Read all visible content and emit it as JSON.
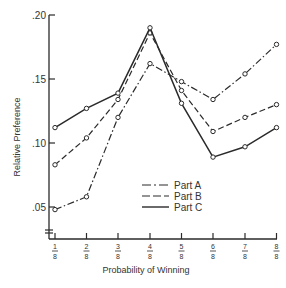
{
  "chart_data": {
    "type": "line",
    "title": "",
    "xlabel": "Probability of Winning",
    "ylabel": "Relative Preference",
    "categories": [
      "1/8",
      "2/8",
      "3/8",
      "4/8",
      "5/8",
      "6/8",
      "7/8",
      "8/8"
    ],
    "x_tick_labels": [
      {
        "num": "1",
        "den": "8"
      },
      {
        "num": "2",
        "den": "8"
      },
      {
        "num": "3",
        "den": "8"
      },
      {
        "num": "4",
        "den": "8"
      },
      {
        "num": "5",
        "den": "8"
      },
      {
        "num": "6",
        "den": "8"
      },
      {
        "num": "7",
        "den": "8"
      },
      {
        "num": "8",
        "den": "8"
      }
    ],
    "y_ticks": [
      0.05,
      0.1,
      0.15,
      0.2
    ],
    "y_tick_labels": [
      ".05",
      ".10",
      ".15",
      ".20"
    ],
    "ylim": [
      0.03,
      0.2
    ],
    "grid": false,
    "legend_position": "lower-center-inside",
    "series": [
      {
        "name": "Part A",
        "style": "dash-dot",
        "values": [
          0.048,
          0.058,
          0.12,
          0.162,
          0.148,
          0.134,
          0.154,
          0.177
        ]
      },
      {
        "name": "Part B",
        "style": "dashed",
        "values": [
          0.083,
          0.104,
          0.134,
          0.186,
          0.141,
          0.109,
          0.12,
          0.13
        ]
      },
      {
        "name": "Part C",
        "style": "solid",
        "values": [
          0.112,
          0.127,
          0.139,
          0.19,
          0.131,
          0.089,
          0.097,
          0.112
        ]
      }
    ],
    "colors": {
      "line": "#2a2a2a",
      "background": "#ffffff"
    }
  }
}
